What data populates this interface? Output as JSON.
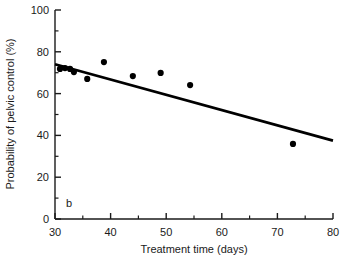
{
  "chart_data": {
    "type": "scatter",
    "title": "",
    "panel_label": "b",
    "xlabel": "Treatment time (days)",
    "ylabel": "Probability of pelvic control (%)",
    "xlim": [
      30,
      80
    ],
    "ylim": [
      0,
      100
    ],
    "xticks": [
      30,
      40,
      50,
      60,
      70,
      80
    ],
    "xtick_labels": [
      "30",
      "40",
      "50",
      "60",
      "70",
      "80"
    ],
    "xminor_ticks": [
      35,
      45,
      55,
      65,
      75
    ],
    "yticks": [
      0,
      20,
      40,
      60,
      80,
      100
    ],
    "ytick_labels": [
      "0",
      "20",
      "40",
      "60",
      "80",
      "100"
    ],
    "yminor_ticks": [
      10,
      30,
      50,
      70,
      90
    ],
    "grid": false,
    "legend": null,
    "tick_direction": "in",
    "marker": "filled-circle",
    "marker_color": "#000000",
    "line_color": "#000000",
    "points": [
      {
        "x": 30.9,
        "y": 71.8
      },
      {
        "x": 31.8,
        "y": 72.2
      },
      {
        "x": 32.7,
        "y": 71.8
      },
      {
        "x": 33.4,
        "y": 70.3
      },
      {
        "x": 35.8,
        "y": 67.0
      },
      {
        "x": 38.8,
        "y": 75.1
      },
      {
        "x": 44.0,
        "y": 68.4
      },
      {
        "x": 49.0,
        "y": 69.9
      },
      {
        "x": 54.3,
        "y": 64.1
      },
      {
        "x": 72.8,
        "y": 35.9
      }
    ],
    "trend_line": {
      "name": "fitted regression line",
      "x": [
        30,
        80
      ],
      "y": [
        74.0,
        37.5
      ]
    }
  }
}
